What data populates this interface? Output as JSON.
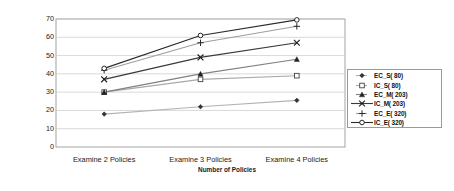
{
  "chart_data": {
    "type": "line",
    "title": "",
    "xlabel": "Number of Policies",
    "ylabel": "Percentage Saved (%)",
    "categories": [
      "Examine 2 Policies",
      "Examine 3 Policies",
      "Examine 4 Policies"
    ],
    "ylim": [
      0,
      70
    ],
    "yticks": [
      0,
      10,
      20,
      30,
      40,
      50,
      60,
      70
    ],
    "ytick_labels": [
      "0",
      "10",
      "20",
      "30",
      "40",
      "50",
      "60",
      "70"
    ],
    "grid": "horizontal",
    "legend_position": "right-inside",
    "series": [
      {
        "name": "EC_S( 80)",
        "values": [
          18,
          22,
          25.5
        ],
        "marker": "diamond",
        "color": "#b3b3b3",
        "marker_color": "#333333"
      },
      {
        "name": "IC_S( 80)",
        "values": [
          30,
          37,
          39
        ],
        "marker": "open-square",
        "color": "#a8a8a8",
        "marker_color": "#444444"
      },
      {
        "name": "EC_M( 203)",
        "values": [
          30,
          40,
          48
        ],
        "marker": "triangle",
        "color": "#808080",
        "marker_color": "#222222"
      },
      {
        "name": "IC_M( 203)",
        "values": [
          37,
          49,
          57
        ],
        "marker": "x-star",
        "color": "#3a3a3a",
        "marker_color": "#1a1a1a"
      },
      {
        "name": "EC_E( 320)",
        "values": [
          42,
          57,
          66
        ],
        "marker": "plus",
        "color": "#9e9e9e",
        "marker_color": "#2a2a2a"
      },
      {
        "name": "IC_E( 320)",
        "values": [
          43,
          61,
          69.5
        ],
        "marker": "open-circle",
        "color": "#2b2b2b",
        "marker_color": "#111111"
      }
    ]
  },
  "legend": {
    "items": [
      {
        "label": "EC_S( 80)"
      },
      {
        "label": "IC_S( 80)"
      },
      {
        "label": "EC_M( 203)"
      },
      {
        "label": "IC_M( 203)"
      },
      {
        "label": "EC_E( 320)"
      },
      {
        "label": "IC_E( 320)"
      }
    ]
  },
  "axes": {
    "y_title": "Percentage Saved (%)",
    "x_title": "Number of Policies",
    "y_ticks": [
      "70",
      "60",
      "50",
      "40",
      "30",
      "20",
      "10",
      "0"
    ],
    "x_ticks": [
      "Examine 2 Policies",
      "Examine 3 Policies",
      "Examine 4 Policies"
    ]
  }
}
